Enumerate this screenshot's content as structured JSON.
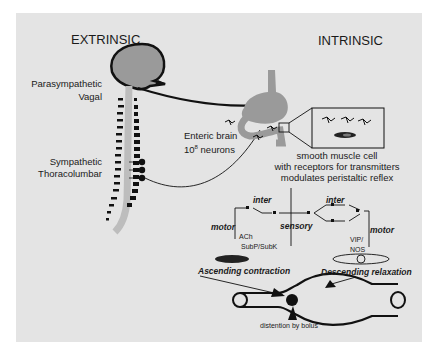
{
  "headings": {
    "extrinsic": "EXTRINSIC",
    "intrinsic": "INTRINSIC"
  },
  "extrinsic_labels": {
    "parasympathetic": "Parasympathetic",
    "vagal": "Vagal",
    "sympathetic": "Sympathetic",
    "thoracolumbar": "Thoracolumbar"
  },
  "enteric": {
    "line1": "Enteric brain",
    "line2_base": "10",
    "line2_exp": "8",
    "line2_rest": " neurons"
  },
  "smooth_muscle": {
    "line1": "smooth muscle cell",
    "line2": "with receptors for transmitters",
    "line3": "modulates peristaltic reflex"
  },
  "reflex_circuit": {
    "inter_left": "inter",
    "inter_right": "inter",
    "sensory": "sensory",
    "motor_left": "motor",
    "motor_right": "motor",
    "ach": "ACh",
    "subp": "SubP/SubK",
    "vip": "VIP/",
    "nos": "NOS"
  },
  "peristalsis": {
    "ascending": "Ascending contraction",
    "descending": "Descending relaxation",
    "distention": "distention by bolus"
  },
  "colors": {
    "panel": "#e4e4e4",
    "organ": "#9a9a9a",
    "spine": "#bdbdbd",
    "ink": "#111111"
  }
}
